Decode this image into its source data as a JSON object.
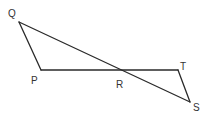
{
  "figure": {
    "type": "geometry",
    "points": {
      "Q": {
        "label": "Q",
        "x": 19,
        "y": 22,
        "label_x": 8,
        "label_y": 17
      },
      "P": {
        "label": "P",
        "x": 41,
        "y": 70,
        "label_x": 31,
        "label_y": 84
      },
      "R": {
        "label": "R",
        "x": 121,
        "y": 70,
        "label_x": 116,
        "label_y": 88
      },
      "T": {
        "label": "T",
        "x": 178,
        "y": 70,
        "label_x": 180,
        "label_y": 70
      },
      "S": {
        "label": "S",
        "x": 190,
        "y": 102,
        "label_x": 193,
        "label_y": 111
      }
    },
    "segments": [
      {
        "name": "QS",
        "from": "Q",
        "to": "S"
      },
      {
        "name": "PT",
        "from": "P",
        "to": "T"
      },
      {
        "name": "QP",
        "from": "Q",
        "to": "P"
      },
      {
        "name": "TS",
        "from": "T",
        "to": "S"
      }
    ],
    "line_color": "#2a2a2a",
    "label_color": "#333333"
  }
}
